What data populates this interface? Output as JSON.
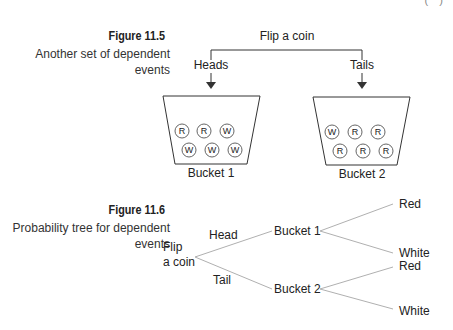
{
  "header_fragment": "( )   ",
  "figure_11_5": {
    "label": "Figure 11.5",
    "caption_line1": "Another set of dependent",
    "caption_line2": "events",
    "root": "Flip a coin",
    "left_branch": "Heads",
    "right_branch": "Tails",
    "buckets": [
      {
        "name": "Bucket 1",
        "row1": [
          "R",
          "R",
          "W"
        ],
        "row2": [
          "W",
          "W",
          "W"
        ]
      },
      {
        "name": "Bucket 2",
        "row1": [
          "W",
          "R",
          "R"
        ],
        "row2": [
          "R",
          "R",
          "R"
        ]
      }
    ]
  },
  "figure_11_6": {
    "label": "Figure 11.6",
    "caption_line1": "Probability tree for dependent",
    "caption_line2": "events",
    "root_line1": "Flip",
    "root_line2": "a coin",
    "branches": [
      {
        "edge": "Head",
        "node": "Bucket 1",
        "leaves": [
          "Red",
          "White"
        ]
      },
      {
        "edge": "Tail",
        "node": "Bucket 2",
        "leaves": [
          "Red",
          "White"
        ]
      }
    ]
  },
  "colors": {
    "line": "#333333",
    "tree_line": "#b0b0b0",
    "text": "#222222"
  }
}
